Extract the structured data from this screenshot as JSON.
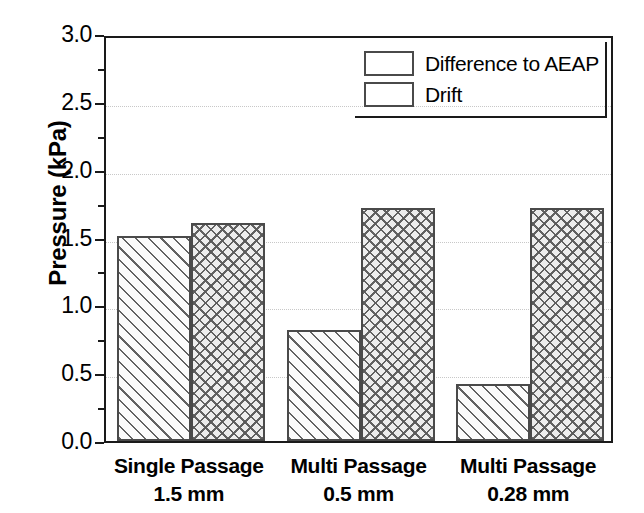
{
  "chart_data": {
    "type": "bar",
    "title": "",
    "xlabel": "",
    "ylabel": "Pressure (kPa)",
    "ylim": [
      0.0,
      3.0
    ],
    "ytick_step": 0.5,
    "yminor_step": 0.25,
    "grid": "horizontal-dotted-major",
    "legend_position": "top-right-inside",
    "categories": [
      "Single Passage 1.5 mm",
      "Multi Passage 0.5 mm",
      "Multi Passage 0.28 mm"
    ],
    "category_lines": [
      [
        "Single Passage",
        "1.5 mm"
      ],
      [
        "Multi Passage",
        "0.5 mm"
      ],
      [
        "Multi Passage",
        "0.28 mm"
      ]
    ],
    "series": [
      {
        "name": "Difference to AEAP",
        "pattern": "diagonal-hatch",
        "values": [
          1.51,
          0.82,
          0.42
        ]
      },
      {
        "name": "Drift",
        "pattern": "crosshatch",
        "values": [
          1.61,
          1.72,
          1.72
        ]
      }
    ],
    "ytick_labels": [
      "0.0",
      "0.5",
      "1.0",
      "1.5",
      "2.0",
      "2.5",
      "3.0"
    ],
    "ytick_values": [
      0.0,
      0.5,
      1.0,
      1.5,
      2.0,
      2.5,
      3.0
    ],
    "colors": {
      "axis": "#1a1a1a",
      "gridline": "#c8c8c8",
      "bar_edge": "#4a4a4a",
      "hatch_fill": "#fbfbfb",
      "cross_fill": "#ededed",
      "text": "#000000",
      "background": "#ffffff"
    }
  },
  "axis": {
    "ylabel": "Pressure (kPa)"
  },
  "legend": {
    "entries": [
      {
        "label": "Difference to AEAP"
      },
      {
        "label": "Drift"
      }
    ]
  }
}
